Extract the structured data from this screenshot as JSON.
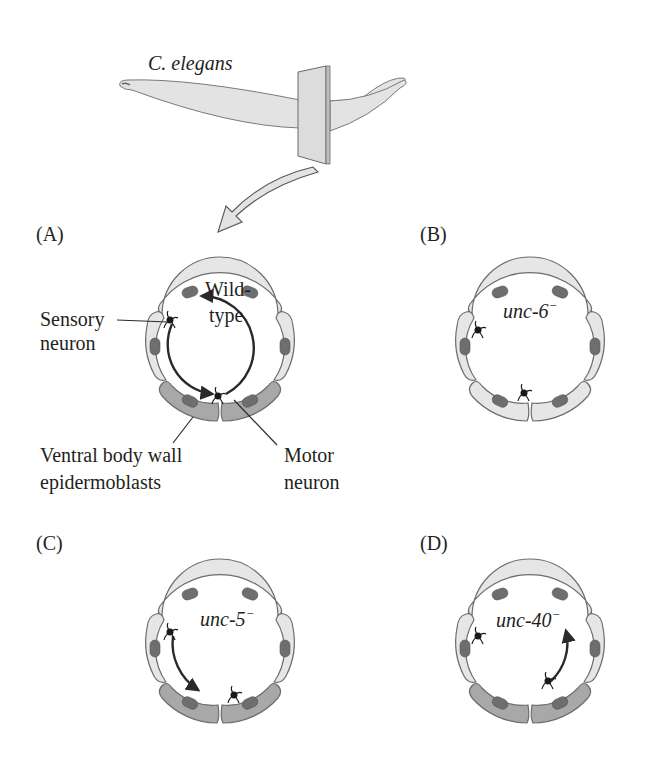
{
  "title": "C. elegans",
  "panels": {
    "A": {
      "label": "(A)",
      "condition_line1": "Wild-",
      "condition_line2": "type",
      "sensory_label_line1": "Sensory",
      "sensory_label_line2": "neuron",
      "epidermoblast_label_line1": "Ventral body wall",
      "epidermoblast_label_line2": "epidermoblasts",
      "motor_label_line1": "Motor",
      "motor_label_line2": "neuron"
    },
    "B": {
      "label": "(B)",
      "condition": "unc-6",
      "superscript": "−"
    },
    "C": {
      "label": "(C)",
      "condition": "unc-5",
      "superscript": "−"
    },
    "D": {
      "label": "(D)",
      "condition": "unc-40",
      "superscript": "−"
    }
  },
  "colors": {
    "dorsal_cell": "#e6e6e6",
    "ventral_cell": "#a8a8a8",
    "nucleus": "#6e6e6e",
    "outline": "#6d6d6d",
    "text": "#231f20"
  }
}
